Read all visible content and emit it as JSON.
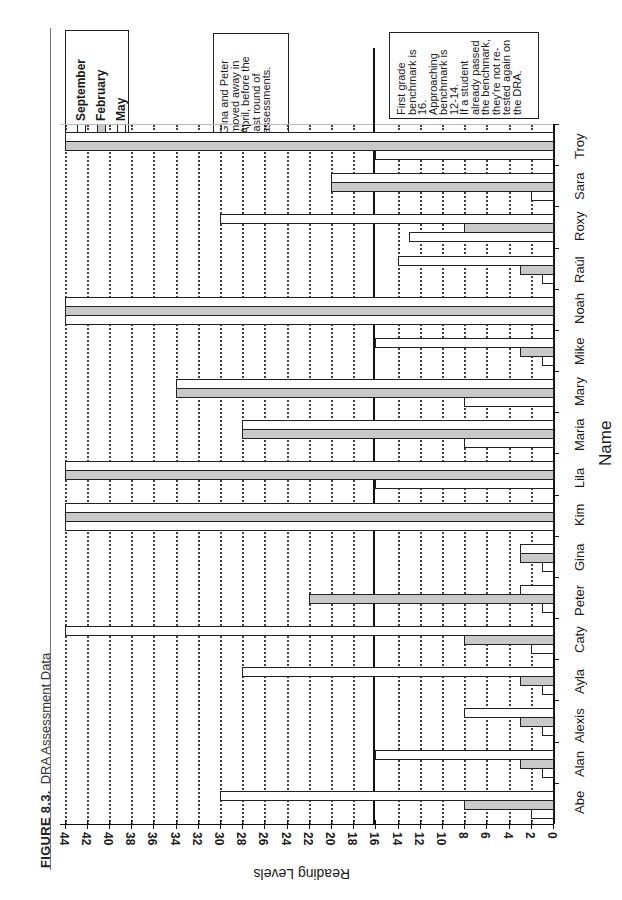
{
  "figure": {
    "label": "FIGURE 8.3.",
    "title": "DRA Assessment Data"
  },
  "legend": {
    "items": [
      {
        "label": "September",
        "color": "#ffffff"
      },
      {
        "label": "February",
        "color": "#c9c9c9"
      },
      {
        "label": "May",
        "color": "#ffffff"
      }
    ]
  },
  "notes": {
    "moved": "Gina and Peter\nmoved away in\nApril, before the\nlast round of\nassessments.",
    "benchmark": "First grade\nbenchmark is\n16.\nApproaching\nbenchmark is\n12-14.\nIf a student\nalready passed\nthe benchmark,\nthey're not re-\ntested again on\nthe DRA."
  },
  "chart_data": {
    "type": "bar",
    "orientation": "vertical (page rotated 90°)",
    "xlabel": "Name",
    "ylabel": "Reading Levels",
    "ylim": [
      0,
      44
    ],
    "yticks": [
      0,
      2,
      4,
      6,
      8,
      10,
      12,
      14,
      16,
      18,
      20,
      22,
      24,
      26,
      28,
      30,
      32,
      34,
      36,
      38,
      40,
      42,
      44
    ],
    "grid": "dotted horizontal gridlines every 2 units",
    "legend_position": "upper right",
    "reference_line": {
      "value": 16,
      "label": "First grade benchmark"
    },
    "categories": [
      "Abe",
      "Alan",
      "Alexis",
      "Ayla",
      "Caty",
      "Peter",
      "Gina",
      "Kim",
      "Lila",
      "Maria",
      "Mary",
      "Mike",
      "Noah",
      "Raúl",
      "Roxy",
      "Sara",
      "Troy"
    ],
    "series": [
      {
        "name": "September",
        "color": "#ffffff",
        "values": [
          2,
          1,
          1,
          1,
          2,
          1,
          1,
          44,
          16,
          8,
          8,
          1,
          44,
          1,
          13,
          2,
          16
        ]
      },
      {
        "name": "February",
        "color": "#c9c9c9",
        "values": [
          8,
          3,
          3,
          3,
          8,
          22,
          3,
          44,
          44,
          28,
          34,
          3,
          44,
          3,
          8,
          20,
          44
        ]
      },
      {
        "name": "May",
        "color": "#ffffff",
        "values": [
          30,
          16,
          8,
          28,
          44,
          3,
          3,
          44,
          44,
          28,
          34,
          16,
          44,
          14,
          30,
          20,
          44
        ]
      }
    ],
    "annotations": [
      "Gina and Peter moved away in April, before the last round of assessments.",
      "First grade benchmark is 16. Approaching benchmark is 12-14. If a student already passed the benchmark, they're not re-tested again on the DRA."
    ]
  }
}
